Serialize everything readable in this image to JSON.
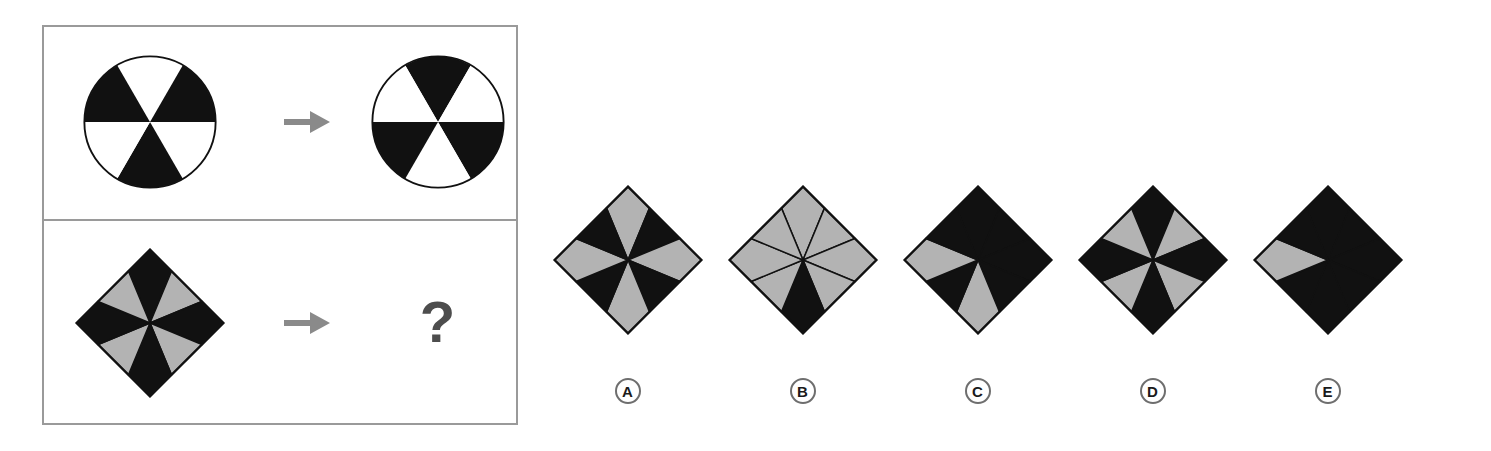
{
  "puzzle": {
    "type": "visual-analogy-matrix",
    "prompt_symbol": "?",
    "arrow_symbol": "→",
    "rule": "color-inversion",
    "colors": {
      "black": "#111111",
      "gray": "#b3b3b3",
      "white": "#ffffff",
      "outline": "#111111",
      "panel_border": "#9a9a9a",
      "arrow": "#8a8a8a",
      "question_mark": "#4d4d4d",
      "label_ring": "#6e6e6e"
    },
    "rows": [
      {
        "id": "row-1",
        "shape": "circle",
        "sectors": 6,
        "source": {
          "name": "circle-source",
          "sector_fills": [
            "white",
            "black",
            "white",
            "black",
            "white",
            "black"
          ]
        },
        "result": {
          "name": "circle-result",
          "sector_fills": [
            "black",
            "white",
            "black",
            "white",
            "black",
            "white"
          ]
        }
      },
      {
        "id": "row-2",
        "shape": "diamond",
        "sectors": 8,
        "source": {
          "name": "diamond-source",
          "sector_fills": [
            "black",
            "gray",
            "black",
            "gray",
            "black",
            "gray",
            "black",
            "gray"
          ]
        },
        "result": {
          "name": "diamond-result-unknown",
          "sector_fills": null
        }
      }
    ],
    "options": [
      {
        "label": "A",
        "name": "option-a",
        "shape": "diamond",
        "sectors": 8,
        "sector_fills": [
          "gray",
          "black",
          "gray",
          "black",
          "gray",
          "black",
          "gray",
          "black"
        ]
      },
      {
        "label": "B",
        "name": "option-b",
        "shape": "diamond",
        "sectors": 8,
        "sector_fills": [
          "gray",
          "gray",
          "gray",
          "gray",
          "black",
          "gray",
          "gray",
          "gray"
        ]
      },
      {
        "label": "C",
        "name": "option-c",
        "shape": "diamond",
        "sectors": 8,
        "sector_fills": [
          "black",
          "black",
          "black",
          "black",
          "gray",
          "black",
          "gray",
          "black"
        ]
      },
      {
        "label": "D",
        "name": "option-d",
        "shape": "diamond",
        "sectors": 8,
        "sector_fills": [
          "black",
          "gray",
          "black",
          "gray",
          "black",
          "gray",
          "black",
          "gray"
        ]
      },
      {
        "label": "E",
        "name": "option-e",
        "shape": "diamond",
        "sectors": 8,
        "sector_fills": [
          "black",
          "black",
          "black",
          "black",
          "black",
          "black",
          "gray",
          "black"
        ]
      }
    ]
  }
}
